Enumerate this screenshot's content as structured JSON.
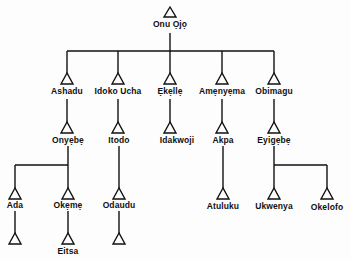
{
  "diagram": {
    "type": "genealogy-tree",
    "symbol": "triangle",
    "colors": {
      "line": "#111111",
      "background": "#fdfdfd"
    },
    "root": {
      "name": "Onu Ọjọ"
    },
    "nodes": [
      {
        "id": "onu_ojo",
        "label": "Onu Ọjọ",
        "parent": null
      },
      {
        "id": "ashadu",
        "label": "Ashadu",
        "parent": "onu_ojo"
      },
      {
        "id": "idoko_ucha",
        "label": "Idoko Ucha",
        "parent": "onu_ojo"
      },
      {
        "id": "ekelle",
        "label": "Ẹkẹllẹ",
        "parent": "onu_ojo"
      },
      {
        "id": "ameneyema",
        "label": "Amẹnyẹma",
        "parent": "onu_ojo"
      },
      {
        "id": "obimagu",
        "label": "Obimagu",
        "parent": "onu_ojo"
      },
      {
        "id": "onyebe",
        "label": "Onyẹbẹ",
        "parent": "ashadu"
      },
      {
        "id": "itodo",
        "label": "Itodo",
        "parent": "idoko_ucha"
      },
      {
        "id": "idakwoji",
        "label": "Idakwoji",
        "parent": "ekelle"
      },
      {
        "id": "akpa",
        "label": "Akpa",
        "parent": "ameneyema"
      },
      {
        "id": "eyigebe",
        "label": "Eyigẹbẹ",
        "parent": "obimagu"
      },
      {
        "id": "ada",
        "label": "Ada",
        "parent": "onyebe"
      },
      {
        "id": "okeme",
        "label": "Okẹmẹ",
        "parent": "onyebe"
      },
      {
        "id": "odaudu",
        "label": "Odaudu",
        "parent": "itodo"
      },
      {
        "id": "atuluku",
        "label": "Atuluku",
        "parent": "akpa"
      },
      {
        "id": "ukwenya",
        "label": "Ukwenya",
        "parent": "eyigebe"
      },
      {
        "id": "okelofo",
        "label": "Okelofo",
        "parent": "eyigebe"
      },
      {
        "id": "ada_child",
        "label": "",
        "parent": "ada"
      },
      {
        "id": "eitsa",
        "label": "Eitsa",
        "parent": "okeme"
      },
      {
        "id": "odaudu_child",
        "label": "",
        "parent": "odaudu"
      }
    ],
    "labels": {
      "onu_ojo": "Onu Ọjọ",
      "ashadu": "Ashadu",
      "idoko_ucha": "Idoko Ucha",
      "ekelle": "Ẹkẹllẹ",
      "ameneyema": "Amẹnyẹma",
      "obimagu": "Obimagu",
      "onyebe": "Onyẹbẹ",
      "itodo": "Itodo",
      "idakwoji": "Idakwoji",
      "akpa": "Akpa",
      "eyigebe": "Eyigẹbẹ",
      "ada": "Ada",
      "okeme": "Okẹmẹ",
      "odaudu": "Odaudu",
      "atuluku": "Atuluku",
      "ukwenya": "Ukwenya",
      "okelofo": "Okelofo",
      "eitsa": "Eitsa"
    }
  }
}
